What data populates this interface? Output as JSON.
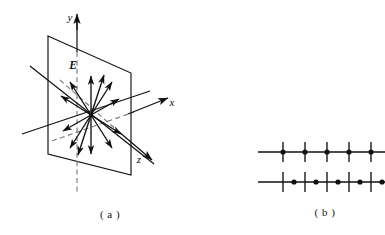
{
  "figure": {
    "title_hidden": "",
    "panels": [
      {
        "id": "panel-a",
        "caption": "( a )",
        "description": "infinite charged plane with radial electric field vectors in 3D axes",
        "axes": [
          {
            "name": "y-axis",
            "label": "y",
            "label_x": 76,
            "label_y": 20
          },
          {
            "name": "x-axis",
            "label": "x",
            "label_x": 172,
            "label_y": 104
          },
          {
            "name": "z-axis",
            "label": "z",
            "label_x": 139,
            "label_y": 162
          }
        ],
        "field_label": "E",
        "field_label_x": 74,
        "field_label_y": 67,
        "arrow_count": 12,
        "plane": {
          "top_left_x": 48,
          "top_left_y": 36,
          "top_right_x": 131,
          "top_right_y": 73,
          "bottom_right_x": 131,
          "bottom_right_y": 175,
          "bottom_left_x": 48,
          "bottom_left_y": 154
        },
        "origin_x": 91,
        "origin_y": 115
      },
      {
        "id": "panel-b",
        "caption": "( b )",
        "description": "two number lines, upper with dots on ticks, lower with dots between ticks",
        "lines": [
          {
            "name": "upper-line",
            "y": 152,
            "x_start": 258,
            "x_end": 385,
            "tick_positions": [
              283,
              305,
              327,
              349,
              371
            ],
            "dot_positions": [
              283,
              305,
              327,
              349,
              371
            ],
            "dots_on_ticks": true
          },
          {
            "name": "lower-line",
            "y": 182,
            "x_start": 258,
            "x_end": 385,
            "tick_positions": [
              283,
              305,
              327,
              349,
              371
            ],
            "dot_positions": [
              294,
              316,
              338,
              360,
              382
            ],
            "dots_on_ticks": false
          }
        ],
        "caption_x": 325,
        "caption_y": 214
      }
    ],
    "colors": {
      "ink": "#111111",
      "caption": "#1a1a1a",
      "background": "#ffffff",
      "dashed": "#555555"
    }
  }
}
